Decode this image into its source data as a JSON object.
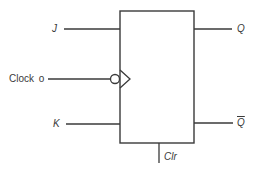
{
  "diagram": {
    "colors": {
      "line": "#3a3a3a",
      "background": "#ffffff"
    },
    "inputs": {
      "j": {
        "label": "J"
      },
      "clock": {
        "label": "Clock",
        "terminal_symbol": "o"
      },
      "k": {
        "label": "K"
      }
    },
    "outputs": {
      "q": {
        "label": "Q"
      },
      "q_bar": {
        "label": "Q",
        "overbar": true
      }
    },
    "control": {
      "clear": {
        "label": "Clr"
      }
    },
    "symbols": {
      "clock_edge": "triangle-icon",
      "clock_inversion": "bubble-icon"
    }
  }
}
